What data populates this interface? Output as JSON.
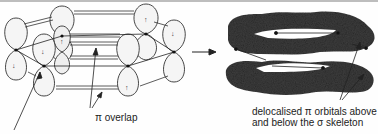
{
  "diagram": {
    "left_panel": {
      "name": "six p orbitals on ring carbons",
      "spin_arrows": [
        "down",
        "up",
        "up",
        "down",
        "down",
        "up"
      ]
    },
    "transition_arrow": "right-arrow",
    "right_panel": {
      "name": "delocalised pi electron clouds"
    },
    "labels": {
      "pi_overlap": "π overlap",
      "delocalised_line1": "delocalised π orbitals above",
      "delocalised_line2": "and below the σ skeleton"
    },
    "colors": {
      "lobe_fill": "#f4f4f4",
      "outline": "#333333",
      "cloud": "#3a3a3a"
    }
  }
}
